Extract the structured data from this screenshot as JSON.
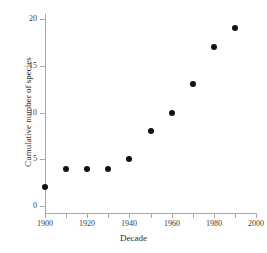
{
  "chart_data": {
    "type": "scatter",
    "title": "",
    "xlabel": "Decade",
    "ylabel": "Cumulative number of species",
    "xlim": [
      1900,
      2000
    ],
    "ylim": [
      0,
      20
    ],
    "grid": false,
    "legend": "none",
    "marker": {
      "shape": "circle",
      "color": "#111111",
      "size_px": 6
    },
    "axis_color": "#a8a8a8",
    "x": [
      1900,
      1910,
      1920,
      1930,
      1940,
      1950,
      1960,
      1970,
      1980,
      1990
    ],
    "values": [
      2,
      4,
      4,
      4,
      5,
      8,
      10,
      13,
      17,
      19
    ],
    "points": [
      {
        "x": 1900,
        "y": 2
      },
      {
        "x": 1910,
        "y": 4
      },
      {
        "x": 1920,
        "y": 4
      },
      {
        "x": 1930,
        "y": 4
      },
      {
        "x": 1940,
        "y": 5
      },
      {
        "x": 1950,
        "y": 8
      },
      {
        "x": 1960,
        "y": 10
      },
      {
        "x": 1970,
        "y": 13
      },
      {
        "x": 1980,
        "y": 17
      },
      {
        "x": 1990,
        "y": 19
      }
    ],
    "x_ticks": [
      {
        "value": 1900,
        "label": "1900"
      },
      {
        "value": 1910,
        "label": ""
      },
      {
        "value": 1920,
        "label": "1920"
      },
      {
        "value": 1930,
        "label": ""
      },
      {
        "value": 1940,
        "label": "1940"
      },
      {
        "value": 1950,
        "label": ""
      },
      {
        "value": 1960,
        "label": "1960"
      },
      {
        "value": 1970,
        "label": ""
      },
      {
        "value": 1980,
        "label": "1980"
      },
      {
        "value": 1990,
        "label": ""
      },
      {
        "value": 2000,
        "label": "2000"
      }
    ],
    "y_ticks": [
      {
        "value": 0,
        "label": "0"
      },
      {
        "value": 5,
        "label": "5"
      },
      {
        "value": 10,
        "label": "10"
      },
      {
        "value": 15,
        "label": "15"
      },
      {
        "value": 20,
        "label": "20"
      }
    ]
  }
}
